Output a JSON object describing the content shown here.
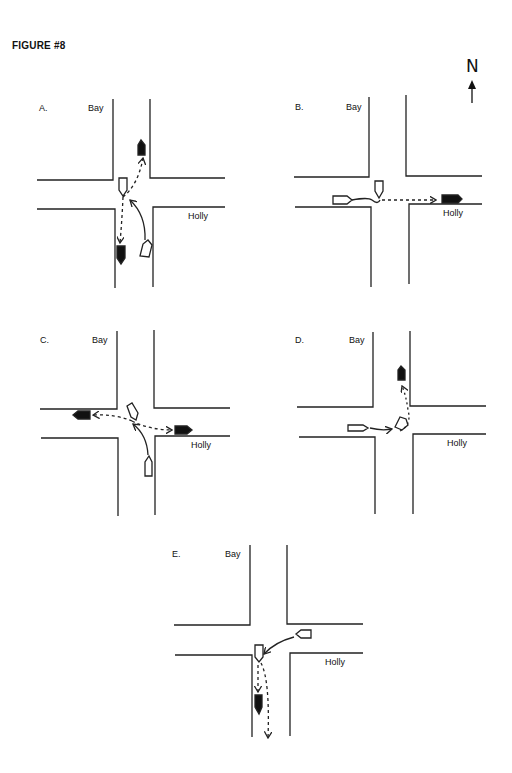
{
  "figure": {
    "title": "FIGURE #8",
    "north_label": "N",
    "north_icon": "north-arrow-icon"
  },
  "panels": [
    {
      "id": "A",
      "label": "A.",
      "street_ns": "Bay",
      "street_ew": "Holly"
    },
    {
      "id": "B",
      "label": "B.",
      "street_ns": "Bay",
      "street_ew": "Holly"
    },
    {
      "id": "C",
      "label": "C.",
      "street_ns": "Bay",
      "street_ew": "Holly"
    },
    {
      "id": "D",
      "label": "D.",
      "street_ns": "Bay",
      "street_ew": "Holly"
    },
    {
      "id": "E",
      "label": "E.",
      "street_ns": "Bay",
      "street_ew": "Holly"
    }
  ],
  "legend_colors": {
    "vehicle_before": "#ffffff",
    "vehicle_after": "#111111",
    "line": "#222222"
  }
}
